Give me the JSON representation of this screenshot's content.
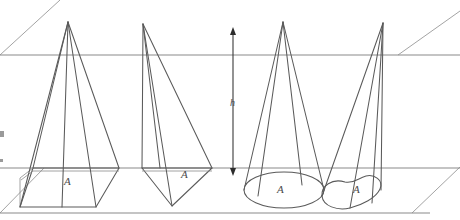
{
  "figure": {
    "height_label": "h",
    "area_labels": [
      "A",
      "A",
      "A",
      "A"
    ],
    "edge_color": "#5a5a5a",
    "plane_color": "#8a8a8a",
    "arrow_color": "#2c2c2c",
    "label_color": "#4a4a4a",
    "background": "#ffffff"
  },
  "planes": {
    "top": {
      "name": "upper-plane",
      "horizontal_y": 55,
      "left_diagonal": "0,55 60,0",
      "right_diagonal": "398,55 460,11"
    },
    "bottom": {
      "name": "lower-plane",
      "horizontal_y": 168,
      "front_y": 213,
      "left_diagonal": "44,168 0,213",
      "right_diagonal": "460,168 412,213"
    }
  },
  "solids": [
    {
      "name": "square-pyramid",
      "kind": "pyramid",
      "base": "quadrilateral",
      "apex": {
        "x": 68,
        "y": 22
      },
      "area_label": "A",
      "area_label_pos": {
        "x": 68,
        "y": 182
      }
    },
    {
      "name": "oblique-tetrahedron",
      "kind": "pyramid",
      "base": "triangle",
      "apex": {
        "x": 143,
        "y": 24
      },
      "area_label": "A",
      "area_label_pos": {
        "x": 185,
        "y": 175
      }
    },
    {
      "name": "circular-cone",
      "kind": "cone",
      "base": "ellipse",
      "apex": {
        "x": 283,
        "y": 22
      },
      "area_label": "A",
      "area_label_pos": {
        "x": 281,
        "y": 190
      }
    },
    {
      "name": "oblique-blob-cone",
      "kind": "cone",
      "base": "irregular-region",
      "apex": {
        "x": 383,
        "y": 23
      },
      "area_label": "A",
      "area_label_pos": {
        "x": 357,
        "y": 190
      }
    }
  ],
  "height_arrow": {
    "name": "height-measure",
    "x": 233,
    "top_y": 29,
    "bottom_y": 172,
    "label": "h",
    "label_pos": {
      "x": 233,
      "y": 103
    }
  }
}
